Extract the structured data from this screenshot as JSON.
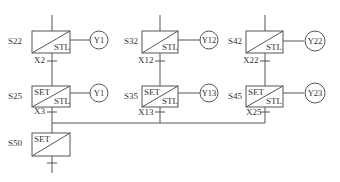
{
  "diagram": {
    "type": "sfc-step-ladder",
    "colors": {
      "line": "#555555",
      "text": "#333333",
      "background": "#ffffff"
    },
    "branches": [
      {
        "id": "branch-1",
        "steps": [
          {
            "label": "S22",
            "set": false,
            "stl": true,
            "output": "Y1",
            "transition": "X2"
          },
          {
            "label": "S25",
            "set": true,
            "stl": true,
            "output": "Y1",
            "transition": "X3"
          }
        ]
      },
      {
        "id": "branch-2",
        "steps": [
          {
            "label": "S32",
            "set": false,
            "stl": true,
            "output": "Y12",
            "transition": "X12"
          },
          {
            "label": "S35",
            "set": true,
            "stl": true,
            "output": "Y13",
            "transition": "X13"
          }
        ]
      },
      {
        "id": "branch-3",
        "steps": [
          {
            "label": "S42",
            "set": false,
            "stl": true,
            "output": "Y22",
            "transition": "X22"
          },
          {
            "label": "S45",
            "set": true,
            "stl": true,
            "output": "Y23",
            "transition": "X25"
          }
        ]
      }
    ],
    "merge_step": {
      "label": "S50",
      "set": true,
      "stl": false
    },
    "text": {
      "set": "SET",
      "stl": "STL"
    }
  }
}
